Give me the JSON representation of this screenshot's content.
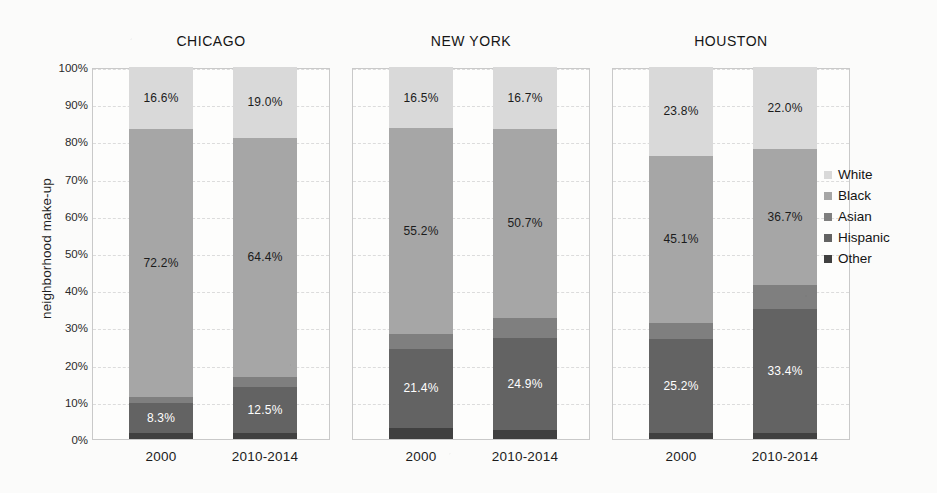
{
  "chart_data": {
    "type": "bar",
    "subtype": "100% stacked bar, small multiples by city",
    "title": "",
    "xlabel": "",
    "ylabel": "neighborhood make-up",
    "ylim": [
      0,
      100
    ],
    "ytick_labels": [
      "0%",
      "10%",
      "20%",
      "30%",
      "40%",
      "50%",
      "60%",
      "70%",
      "80%",
      "90%",
      "100%"
    ],
    "ytick_values": [
      0,
      10,
      20,
      30,
      40,
      50,
      60,
      70,
      80,
      90,
      100
    ],
    "grid": true,
    "legend_position": "right",
    "categories": [
      "2000",
      "2010-2014"
    ],
    "panels": [
      {
        "name": "CHICAGO",
        "bars": [
          {
            "category": "2000",
            "segments": [
              {
                "series": "White",
                "value": 16.6,
                "label": "16.6%",
                "show_label": true,
                "label_color": "dark"
              },
              {
                "series": "Black",
                "value": 72.2,
                "label": "72.2%",
                "show_label": true,
                "label_color": "dark"
              },
              {
                "series": "Asian",
                "value": 1.4,
                "label": "1.4%",
                "show_label": false,
                "label_color": "light"
              },
              {
                "series": "Hispanic",
                "value": 8.3,
                "label": "8.3%",
                "show_label": true,
                "label_color": "light"
              },
              {
                "series": "Other",
                "value": 1.5,
                "label": "1.5%",
                "show_label": false,
                "label_color": "light"
              }
            ]
          },
          {
            "category": "2010-2014",
            "segments": [
              {
                "series": "White",
                "value": 19.0,
                "label": "19.0%",
                "show_label": true,
                "label_color": "dark"
              },
              {
                "series": "Black",
                "value": 64.4,
                "label": "64.4%",
                "show_label": true,
                "label_color": "dark"
              },
              {
                "series": "Asian",
                "value": 2.6,
                "label": "2.6%",
                "show_label": false,
                "label_color": "light"
              },
              {
                "series": "Hispanic",
                "value": 12.5,
                "label": "12.5%",
                "show_label": true,
                "label_color": "light"
              },
              {
                "series": "Other",
                "value": 1.5,
                "label": "1.5%",
                "show_label": false,
                "label_color": "light"
              }
            ]
          }
        ]
      },
      {
        "name": "NEW YORK",
        "bars": [
          {
            "category": "2000",
            "segments": [
              {
                "series": "White",
                "value": 16.5,
                "label": "16.5%",
                "show_label": true,
                "label_color": "dark"
              },
              {
                "series": "Black",
                "value": 55.2,
                "label": "55.2%",
                "show_label": true,
                "label_color": "dark"
              },
              {
                "series": "Asian",
                "value": 4.0,
                "label": "4.0%",
                "show_label": false,
                "label_color": "light"
              },
              {
                "series": "Hispanic",
                "value": 21.4,
                "label": "21.4%",
                "show_label": true,
                "label_color": "light"
              },
              {
                "series": "Other",
                "value": 2.9,
                "label": "2.9%",
                "show_label": false,
                "label_color": "light"
              }
            ]
          },
          {
            "category": "2010-2014",
            "segments": [
              {
                "series": "White",
                "value": 16.7,
                "label": "16.7%",
                "show_label": true,
                "label_color": "dark"
              },
              {
                "series": "Black",
                "value": 50.7,
                "label": "50.7%",
                "show_label": true,
                "label_color": "dark"
              },
              {
                "series": "Asian",
                "value": 5.4,
                "label": "5.4%",
                "show_label": false,
                "label_color": "light"
              },
              {
                "series": "Hispanic",
                "value": 24.9,
                "label": "24.9%",
                "show_label": true,
                "label_color": "light"
              },
              {
                "series": "Other",
                "value": 2.3,
                "label": "2.3%",
                "show_label": false,
                "label_color": "light"
              }
            ]
          }
        ]
      },
      {
        "name": "HOUSTON",
        "bars": [
          {
            "category": "2000",
            "segments": [
              {
                "series": "White",
                "value": 23.8,
                "label": "23.8%",
                "show_label": true,
                "label_color": "dark"
              },
              {
                "series": "Black",
                "value": 45.1,
                "label": "45.1%",
                "show_label": true,
                "label_color": "dark"
              },
              {
                "series": "Asian",
                "value": 4.2,
                "label": "4.2%",
                "show_label": false,
                "label_color": "light"
              },
              {
                "series": "Hispanic",
                "value": 25.2,
                "label": "25.2%",
                "show_label": true,
                "label_color": "light"
              },
              {
                "series": "Other",
                "value": 1.7,
                "label": "1.7%",
                "show_label": false,
                "label_color": "light"
              }
            ]
          },
          {
            "category": "2010-2014",
            "segments": [
              {
                "series": "White",
                "value": 22.0,
                "label": "22.0%",
                "show_label": true,
                "label_color": "dark"
              },
              {
                "series": "Black",
                "value": 36.7,
                "label": "36.7%",
                "show_label": true,
                "label_color": "dark"
              },
              {
                "series": "Asian",
                "value": 6.3,
                "label": "6.3%",
                "show_label": false,
                "label_color": "light"
              },
              {
                "series": "Hispanic",
                "value": 33.4,
                "label": "33.4%",
                "show_label": true,
                "label_color": "light"
              },
              {
                "series": "Other",
                "value": 1.6,
                "label": "1.6%",
                "show_label": false,
                "label_color": "light"
              }
            ]
          }
        ]
      }
    ],
    "series": [
      {
        "name": "White",
        "color": "#d9d9d9"
      },
      {
        "name": "Black",
        "color": "#a6a6a6"
      },
      {
        "name": "Asian",
        "color": "#7f7f7f"
      },
      {
        "name": "Hispanic",
        "color": "#636363"
      },
      {
        "name": "Other",
        "color": "#404040"
      }
    ],
    "legend": [
      {
        "label": "White",
        "color": "#d9d9d9"
      },
      {
        "label": "Black",
        "color": "#a6a6a6"
      },
      {
        "label": "Asian",
        "color": "#7f7f7f"
      },
      {
        "label": "Hispanic",
        "color": "#636363"
      },
      {
        "label": "Other",
        "color": "#404040"
      }
    ]
  }
}
